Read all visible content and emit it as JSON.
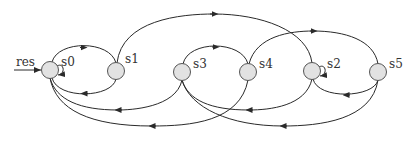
{
  "diagram": {
    "type": "state-machine",
    "colors": {
      "node_fill": "#e2e2e2",
      "node_stroke": "#555555",
      "edge": "#2a2a2a",
      "text": "#333333"
    },
    "reset_label": "res",
    "nodes": [
      {
        "id": "s0",
        "label": "s0"
      },
      {
        "id": "s1",
        "label": "s1"
      },
      {
        "id": "s3",
        "label": "s3"
      },
      {
        "id": "s4",
        "label": "s4"
      },
      {
        "id": "s2",
        "label": "s2"
      },
      {
        "id": "s5",
        "label": "s5"
      }
    ],
    "edges": [
      {
        "from": "res",
        "to": "s0"
      },
      {
        "from": "s0",
        "to": "s0"
      },
      {
        "from": "s0",
        "to": "s1"
      },
      {
        "from": "s1",
        "to": "s0"
      },
      {
        "from": "s1",
        "to": "s2"
      },
      {
        "from": "s3",
        "to": "s4"
      },
      {
        "from": "s4",
        "to": "s5"
      },
      {
        "from": "s2",
        "to": "s2"
      },
      {
        "from": "s5",
        "to": "s2"
      },
      {
        "from": "s3",
        "to": "s0"
      },
      {
        "from": "s4",
        "to": "s0"
      },
      {
        "from": "s2",
        "to": "s3"
      },
      {
        "from": "s5",
        "to": "s3"
      }
    ]
  }
}
